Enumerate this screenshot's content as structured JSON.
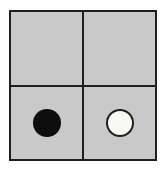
{
  "figure": {
    "rows": 2,
    "cols": 2,
    "cells": [
      {
        "row": 0,
        "col": 0,
        "token": "none"
      },
      {
        "row": 0,
        "col": 1,
        "token": "none"
      },
      {
        "row": 1,
        "col": 0,
        "token": "black-disc"
      },
      {
        "row": 1,
        "col": 1,
        "token": "white-disc"
      }
    ]
  },
  "colors": {
    "background": "#ffffff",
    "cell_fill": "#c9c9c9",
    "grid_line": "#1f1f1f",
    "black_disc_fill": "#0e0e0e",
    "white_disc_fill": "#f9f9f4",
    "white_disc_outline": "#1f1f1f"
  }
}
